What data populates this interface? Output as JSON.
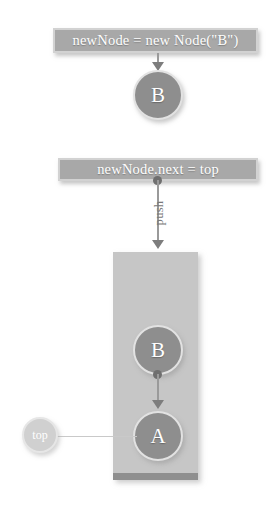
{
  "diagram": {
    "labels": [
      {
        "id": "new-node",
        "text": "newNode = new Node(\"B\")"
      },
      {
        "id": "next-top",
        "text": "newNode.next = top"
      }
    ],
    "nodes": [
      {
        "id": "b-standalone",
        "text": "B"
      },
      {
        "id": "b-stack",
        "text": "B"
      },
      {
        "id": "a-stack",
        "text": "A"
      },
      {
        "id": "top-pointer",
        "text": "top"
      }
    ],
    "edges": [
      {
        "id": "push",
        "label": "push"
      }
    ],
    "colors": {
      "background": "#ffffff",
      "node_fill": "#8e8e8e",
      "node_border": "#e2e2e2",
      "node_text": "#ffffff",
      "pointer_fill": "#d0d0d0",
      "label_fill": "#a8a8a8",
      "label_border": "#d2d2d2",
      "container_fill": "#c6c6c6",
      "container_base": "#8f8f8f",
      "connector": "#9a9a9a",
      "arrowhead": "#7d7d7d",
      "edge_label_text": "#787878"
    }
  }
}
